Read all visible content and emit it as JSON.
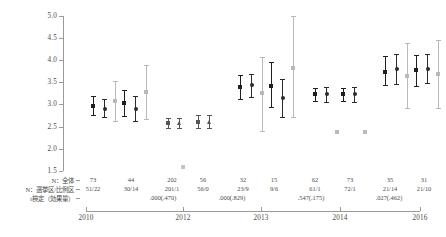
{
  "chart_data": {
    "type": "scatter",
    "title": "",
    "xlabel": "",
    "ylabel": "",
    "ylim": [
      1.5,
      5.0
    ],
    "yticks": [
      "5.0",
      "4.5",
      "4.0",
      "3.5",
      "3.0",
      "2.5",
      "2.0",
      "1.5"
    ],
    "ytick_values": [
      5.0,
      4.5,
      4.0,
      3.5,
      3.0,
      2.5,
      2.0,
      1.5
    ],
    "xticks": [
      "2010",
      "2012",
      "2013",
      "2014",
      "2016"
    ],
    "xtick_positions": [
      2010,
      2012,
      2013,
      2014,
      2016
    ],
    "grid": false,
    "legend_position": "none",
    "series": [
      {
        "name": "dark-square",
        "marker": "square",
        "color": "#1f1f1f",
        "points": [
          {
            "group": 1,
            "x": 93,
            "value": 2.97,
            "low": 2.77,
            "high": 3.2
          },
          {
            "group": 2,
            "x": 124,
            "value": 3.04,
            "low": 2.75,
            "high": 3.33
          },
          {
            "group": 3,
            "x": 240,
            "value": 3.4,
            "low": 3.13,
            "high": 3.67
          },
          {
            "group": 4,
            "x": 271,
            "value": 3.42,
            "low": 2.95,
            "high": 3.96
          },
          {
            "group": 5,
            "x": 315,
            "value": 3.23,
            "low": 3.08,
            "high": 3.38
          },
          {
            "group": 6,
            "x": 343,
            "value": 3.23,
            "low": 3.08,
            "high": 3.38
          },
          {
            "group": 7,
            "x": 385,
            "value": 3.74,
            "low": 3.44,
            "high": 4.1
          },
          {
            "group": 8,
            "x": 416,
            "value": 3.77,
            "low": 3.42,
            "high": 4.11
          }
        ]
      },
      {
        "name": "dark-circle",
        "marker": "circle",
        "color": "#2b2b2b",
        "points": [
          {
            "group": 1,
            "x": 104,
            "value": 2.91,
            "low": 2.71,
            "high": 3.12
          },
          {
            "group": 2,
            "x": 135,
            "value": 2.91,
            "low": 2.62,
            "high": 3.2
          },
          {
            "group": 3,
            "x": 251,
            "value": 3.44,
            "low": 3.18,
            "high": 3.7
          },
          {
            "group": 4,
            "x": 282,
            "value": 3.15,
            "low": 2.72,
            "high": 3.57
          },
          {
            "group": 5,
            "x": 326,
            "value": 3.23,
            "low": 3.06,
            "high": 3.4
          },
          {
            "group": 6,
            "x": 354,
            "value": 3.23,
            "low": 3.06,
            "high": 3.4
          },
          {
            "group": 7,
            "x": 396,
            "value": 3.8,
            "low": 3.47,
            "high": 4.14
          },
          {
            "group": 8,
            "x": 427,
            "value": 3.81,
            "low": 3.48,
            "high": 4.14
          }
        ]
      },
      {
        "name": "light-square",
        "marker": "square",
        "color": "#b9b9b9",
        "points": [
          {
            "group": 1,
            "x": 115,
            "value": 3.09,
            "low": 2.64,
            "high": 3.54
          },
          {
            "group": 2,
            "x": 146,
            "value": 3.29,
            "low": 2.68,
            "high": 3.9
          },
          {
            "group": 3,
            "x": 262,
            "value": 3.27,
            "low": 2.4,
            "high": 4.07
          },
          {
            "group": 4,
            "x": 293,
            "value": 3.82,
            "low": 2.71,
            "high": 5.0
          },
          {
            "group": 5,
            "x": 337,
            "value": 2.37,
            "low": null,
            "high": null
          },
          {
            "group": 6,
            "x": 365,
            "value": 2.37,
            "low": null,
            "high": null
          },
          {
            "group": 7,
            "x": 407,
            "value": 3.65,
            "low": 2.93,
            "high": 4.38
          },
          {
            "group": 8,
            "x": 438,
            "value": 3.69,
            "low": 2.92,
            "high": 4.45
          }
        ]
      },
      {
        "name": "mid-dark-square",
        "marker": "square",
        "color": "#555555",
        "points": [
          {
            "group": 9,
            "x": 168,
            "value": 2.59,
            "low": 2.48,
            "high": 2.7
          },
          {
            "group": 10,
            "x": 198,
            "value": 2.61,
            "low": 2.47,
            "high": 2.76
          }
        ]
      },
      {
        "name": "mid-triangle",
        "marker": "triangle",
        "color": "#555555",
        "points": [
          {
            "group": 9,
            "x": 179,
            "value": 2.58,
            "low": 2.47,
            "high": 2.7
          },
          {
            "group": 10,
            "x": 209,
            "value": 2.61,
            "low": 2.46,
            "high": 2.76
          }
        ]
      },
      {
        "name": "outlier-light-square",
        "marker": "square",
        "color": "#c4c4c4",
        "points": [
          {
            "group": 11,
            "x": 183,
            "value": 1.58,
            "low": null,
            "high": null
          }
        ]
      }
    ]
  },
  "yaxis": {
    "ticks": [
      "5.0",
      "4.5",
      "4.0",
      "3.5",
      "3.0",
      "2.5",
      "2.0",
      "1.5"
    ]
  },
  "xaxis": {
    "ticks": [
      "2010",
      "2012",
      "2013",
      "2014",
      "2016"
    ]
  },
  "annotation_table": {
    "row_labels": [
      "N：全体",
      "N：選挙区/比例区",
      "t検定（効果量）"
    ],
    "n_total": [
      "73",
      "44",
      "202",
      "56",
      "32",
      "15",
      "62",
      "73",
      "35",
      "31"
    ],
    "n_split": [
      "51/22",
      "30/14",
      "201/1",
      "56/0",
      "23/9",
      "9/6",
      "61/1",
      "72/1",
      "21/14",
      "21/10"
    ],
    "pvalues": [
      {
        "text": ".000(.470)"
      },
      {
        "text": ".000(.829)"
      },
      {
        "text": ".547(.175)"
      },
      {
        "text": ".027(.462)"
      }
    ]
  }
}
